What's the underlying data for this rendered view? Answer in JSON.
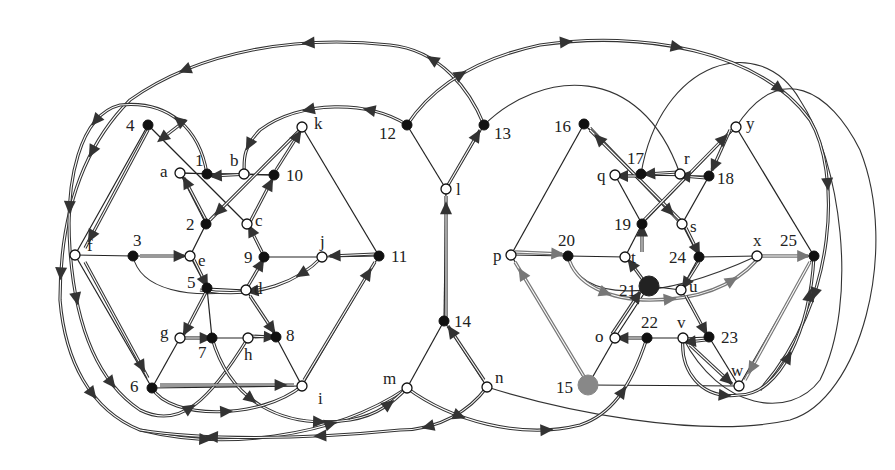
{
  "diagram": {
    "colors": {
      "edge": "#222222",
      "path_dark": "#333333",
      "path_gray": "#777777",
      "node_filled": "#111111",
      "node_open": "#ffffff",
      "node_special_gray": "#888888"
    },
    "nodes": [
      {
        "id": "4",
        "label": "4",
        "x": 148,
        "y": 125,
        "type": "filled",
        "lx": -22,
        "ly": 6
      },
      {
        "id": "k",
        "label": "k",
        "x": 302,
        "y": 127,
        "type": "open",
        "lx": 12,
        "ly": 2
      },
      {
        "id": "a",
        "label": "a",
        "x": 180,
        "y": 173,
        "type": "open",
        "lx": -20,
        "ly": 4
      },
      {
        "id": "1",
        "label": "1",
        "x": 207,
        "y": 174,
        "type": "filled",
        "lx": -12,
        "ly": -8
      },
      {
        "id": "b",
        "label": "b",
        "x": 244,
        "y": 174,
        "type": "open",
        "lx": -14,
        "ly": -8
      },
      {
        "id": "10",
        "label": "10",
        "x": 274,
        "y": 175,
        "type": "filled",
        "lx": 12,
        "ly": 6
      },
      {
        "id": "2",
        "label": "2",
        "x": 206,
        "y": 224,
        "type": "filled",
        "lx": -20,
        "ly": 6
      },
      {
        "id": "c",
        "label": "c",
        "x": 247,
        "y": 224,
        "type": "open",
        "lx": 8,
        "ly": 2
      },
      {
        "id": "f",
        "label": "f",
        "x": 75,
        "y": 255,
        "type": "open",
        "lx": 12,
        "ly": -4
      },
      {
        "id": "3",
        "label": "3",
        "x": 133,
        "y": 256,
        "type": "filled",
        "lx": 0,
        "ly": -10
      },
      {
        "id": "e",
        "label": "e",
        "x": 190,
        "y": 256,
        "type": "open",
        "lx": 8,
        "ly": 10
      },
      {
        "id": "9",
        "label": "9",
        "x": 264,
        "y": 257,
        "type": "filled",
        "lx": -20,
        "ly": 6
      },
      {
        "id": "j",
        "label": "j",
        "x": 322,
        "y": 257,
        "type": "open",
        "lx": -2,
        "ly": -10
      },
      {
        "id": "11",
        "label": "11",
        "x": 379,
        "y": 256,
        "type": "filled",
        "lx": 12,
        "ly": 6
      },
      {
        "id": "5",
        "label": "5",
        "x": 207,
        "y": 288,
        "type": "filled",
        "lx": -20,
        "ly": 0
      },
      {
        "id": "d",
        "label": "d",
        "x": 246,
        "y": 290,
        "type": "open",
        "lx": 8,
        "ly": 4
      },
      {
        "id": "g",
        "label": "g",
        "x": 180,
        "y": 338,
        "type": "open",
        "lx": -20,
        "ly": 0
      },
      {
        "id": "7",
        "label": "7",
        "x": 212,
        "y": 338,
        "type": "filled",
        "lx": -14,
        "ly": 20
      },
      {
        "id": "h",
        "label": "h",
        "x": 248,
        "y": 338,
        "type": "open",
        "lx": -4,
        "ly": 22
      },
      {
        "id": "8",
        "label": "8",
        "x": 276,
        "y": 337,
        "type": "filled",
        "lx": 10,
        "ly": 4
      },
      {
        "id": "6",
        "label": "6",
        "x": 152,
        "y": 388,
        "type": "filled",
        "lx": -22,
        "ly": 4
      },
      {
        "id": "i",
        "label": "i",
        "x": 302,
        "y": 386,
        "type": "open",
        "lx": 16,
        "ly": 18
      },
      {
        "id": "12",
        "label": "12",
        "x": 407,
        "y": 125,
        "type": "filled",
        "lx": -28,
        "ly": 14
      },
      {
        "id": "13",
        "label": "13",
        "x": 484,
        "y": 125,
        "type": "filled",
        "lx": 10,
        "ly": 14
      },
      {
        "id": "l",
        "label": "l",
        "x": 446,
        "y": 189,
        "type": "open",
        "lx": 10,
        "ly": 6
      },
      {
        "id": "14",
        "label": "14",
        "x": 444,
        "y": 321,
        "type": "filled",
        "lx": 10,
        "ly": 6
      },
      {
        "id": "m",
        "label": "m",
        "x": 407,
        "y": 388,
        "type": "open",
        "lx": -24,
        "ly": -4
      },
      {
        "id": "n",
        "label": "n",
        "x": 487,
        "y": 387,
        "type": "open",
        "lx": 8,
        "ly": -4
      },
      {
        "id": "16",
        "label": "16",
        "x": 584,
        "y": 124,
        "type": "filled",
        "lx": -30,
        "ly": 8
      },
      {
        "id": "y",
        "label": "y",
        "x": 736,
        "y": 127,
        "type": "open",
        "lx": 10,
        "ly": 2
      },
      {
        "id": "q",
        "label": "q",
        "x": 615,
        "y": 175,
        "type": "open",
        "lx": -18,
        "ly": 6
      },
      {
        "id": "17",
        "label": "17",
        "x": 641,
        "y": 174,
        "type": "filled",
        "lx": -14,
        "ly": -10
      },
      {
        "id": "r",
        "label": "r",
        "x": 680,
        "y": 174,
        "type": "open",
        "lx": 4,
        "ly": -10
      },
      {
        "id": "18",
        "label": "18",
        "x": 709,
        "y": 176,
        "type": "filled",
        "lx": 8,
        "ly": 8
      },
      {
        "id": "19",
        "label": "19",
        "x": 642,
        "y": 224,
        "type": "filled",
        "lx": -28,
        "ly": 6
      },
      {
        "id": "s",
        "label": "s",
        "x": 682,
        "y": 224,
        "type": "open",
        "lx": 8,
        "ly": 8
      },
      {
        "id": "p",
        "label": "p",
        "x": 511,
        "y": 255,
        "type": "open",
        "lx": -18,
        "ly": 6
      },
      {
        "id": "20",
        "label": "20",
        "x": 568,
        "y": 256,
        "type": "filled",
        "lx": -10,
        "ly": -10
      },
      {
        "id": "t",
        "label": "t",
        "x": 625,
        "y": 257,
        "type": "open",
        "lx": 6,
        "ly": 6
      },
      {
        "id": "24",
        "label": "24",
        "x": 699,
        "y": 257,
        "type": "filled",
        "lx": -30,
        "ly": 6
      },
      {
        "id": "x",
        "label": "x",
        "x": 757,
        "y": 256,
        "type": "open",
        "lx": -4,
        "ly": -10
      },
      {
        "id": "25",
        "label": "25",
        "x": 814,
        "y": 256,
        "type": "filled",
        "lx": -34,
        "ly": -10
      },
      {
        "id": "21",
        "label": "21",
        "x": 649,
        "y": 286,
        "type": "big",
        "lx": -30,
        "ly": 10
      },
      {
        "id": "u",
        "label": "u",
        "x": 681,
        "y": 290,
        "type": "open",
        "lx": 8,
        "ly": 2
      },
      {
        "id": "o",
        "label": "o",
        "x": 615,
        "y": 338,
        "type": "open",
        "lx": -20,
        "ly": 4
      },
      {
        "id": "22",
        "label": "22",
        "x": 647,
        "y": 338,
        "type": "filled",
        "lx": -6,
        "ly": -10
      },
      {
        "id": "v",
        "label": "v",
        "x": 683,
        "y": 338,
        "type": "open",
        "lx": -6,
        "ly": -10
      },
      {
        "id": "23",
        "label": "23",
        "x": 709,
        "y": 337,
        "type": "filled",
        "lx": 12,
        "ly": 6
      },
      {
        "id": "15",
        "label": "15",
        "x": 588,
        "y": 385,
        "type": "gray",
        "lx": -32,
        "ly": 8
      },
      {
        "id": "w",
        "label": "w",
        "x": 739,
        "y": 386,
        "type": "open",
        "lx": -8,
        "ly": -10
      }
    ],
    "edges": [
      [
        "4",
        "f"
      ],
      [
        "4",
        "c"
      ],
      [
        "k",
        "2"
      ],
      [
        "k",
        "11"
      ],
      [
        "a",
        "10"
      ],
      [
        "a",
        "1"
      ],
      [
        "1",
        "b"
      ],
      [
        "b",
        "10"
      ],
      [
        "2",
        "a"
      ],
      [
        "2",
        "e"
      ],
      [
        "c",
        "9"
      ],
      [
        "f",
        "3"
      ],
      [
        "3",
        "e"
      ],
      [
        "f",
        "6"
      ],
      [
        "9",
        "j"
      ],
      [
        "j",
        "11"
      ],
      [
        "e",
        "5"
      ],
      [
        "9",
        "d"
      ],
      [
        "5",
        "d"
      ],
      [
        "5",
        "7"
      ],
      [
        "d",
        "8"
      ],
      [
        "g",
        "7"
      ],
      [
        "7",
        "h"
      ],
      [
        "h",
        "8"
      ],
      [
        "g",
        "6"
      ],
      [
        "8",
        "i"
      ],
      [
        "6",
        "i"
      ],
      [
        "11",
        "i"
      ],
      [
        "12",
        "l"
      ],
      [
        "13",
        "l"
      ],
      [
        "l",
        "14"
      ],
      [
        "14",
        "m"
      ],
      [
        "14",
        "n"
      ],
      [
        "16",
        "p"
      ],
      [
        "16",
        "s"
      ],
      [
        "y",
        "19"
      ],
      [
        "y",
        "25"
      ],
      [
        "q",
        "18"
      ],
      [
        "19",
        "q"
      ],
      [
        "19",
        "t"
      ],
      [
        "s",
        "18"
      ],
      [
        "s",
        "24"
      ],
      [
        "p",
        "20"
      ],
      [
        "20",
        "t"
      ],
      [
        "24",
        "x"
      ],
      [
        "x",
        "25"
      ],
      [
        "t",
        "21"
      ],
      [
        "24",
        "u"
      ],
      [
        "21",
        "u"
      ],
      [
        "21",
        "o"
      ],
      [
        "u",
        "23"
      ],
      [
        "o",
        "22"
      ],
      [
        "22",
        "v"
      ],
      [
        "v",
        "23"
      ],
      [
        "o",
        "15"
      ],
      [
        "23",
        "w"
      ],
      [
        "15",
        "w"
      ],
      [
        "25",
        "w"
      ],
      [
        "p",
        "15"
      ]
    ],
    "thin_curves": [
      "M 484 125 C 540 70, 640 60, 680 174",
      "M 641 174 C 660 60, 760 30, 800 100 C 840 160, 860 300, 820 380 C 790 420, 720 410, 683 338",
      "M 487 387 C 560 410, 700 440, 790 420 C 860 400, 900 250, 860 150 C 830 90, 780 60, 736 127",
      "M 133 256 C 140 290, 190 300, 246 290",
      "M 568 256 C 580 300, 650 305, 757 256"
    ],
    "dark_paths": [
      {
        "d": "M 484 125 C 470 90, 440 50, 390 45 C 300 35, 200 50, 130 100 C 80 150, 60 220, 60 300 C 65 360, 90 410, 140 430 C 220 450, 330 440, 407 388",
        "arrows": [
          0.08,
          0.2,
          0.32,
          0.44,
          0.56,
          0.68,
          0.8,
          0.92
        ]
      },
      {
        "d": "M 407 125 C 370 100, 300 100, 260 130 C 240 150, 245 165, 244 174",
        "arrows": [
          0.2,
          0.5,
          0.85
        ]
      },
      {
        "d": "M 207 174 C 200 130, 170 100, 120 105 C 80 115, 65 180, 70 250 C 75 320, 95 380, 140 410 C 180 430, 210 400, 248 338",
        "arrows": [
          0.1,
          0.25,
          0.4,
          0.55,
          0.7,
          0.85
        ]
      },
      {
        "d": "M 407 125 C 430 90, 470 60, 540 45 C 640 30, 760 50, 810 120 C 840 170, 840 300, 760 390",
        "arrows": [
          0.1,
          0.25,
          0.4,
          0.55,
          0.7,
          0.85
        ]
      },
      {
        "d": "M 407 388 C 450 420, 520 440, 580 425 C 610 415, 630 390, 647 338",
        "arrows": [
          0.2,
          0.5,
          0.8
        ]
      },
      {
        "d": "M 212 338 C 230 400, 280 430, 350 420 C 380 415, 395 400, 407 388",
        "arrows": [
          0.3,
          0.6,
          0.9
        ]
      },
      {
        "d": "M 152 388 C 170 420, 260 420, 302 386",
        "arrows": [
          0.5
        ]
      },
      {
        "d": "M 487 387 C 470 410, 440 430, 400 430 C 300 440, 200 440, 140 430",
        "arrows": [
          0.2,
          0.5,
          0.8
        ]
      },
      {
        "d": "M 683 338 C 680 370, 700 400, 739 395 C 780 395, 810 330, 814 256",
        "arrows": [
          0.3,
          0.6,
          0.85
        ]
      },
      {
        "d": "M 322 257 C 300 280, 260 300, 200 290",
        "arrows": [
          0.2,
          0.6
        ]
      }
    ],
    "straight_arrows": [
      {
        "from": [
          148,
          130
        ],
        "to": [
          85,
          248
        ],
        "type": "dark"
      },
      {
        "from": [
          85,
          262
        ],
        "to": [
          148,
          378
        ],
        "type": "dark"
      },
      {
        "from": [
          160,
          385
        ],
        "to": [
          294,
          385
        ],
        "type": "dark"
      },
      {
        "from": [
          304,
          380
        ],
        "to": [
          375,
          262
        ],
        "type": "dark"
      },
      {
        "from": [
          375,
          254
        ],
        "to": [
          330,
          256
        ],
        "type": "dark"
      },
      {
        "from": [
          140,
          256
        ],
        "to": [
          184,
          256
        ],
        "type": "dark"
      },
      {
        "from": [
          206,
          220
        ],
        "to": [
          184,
          178
        ],
        "type": "dark"
      },
      {
        "from": [
          250,
          174
        ],
        "to": [
          212,
          176
        ],
        "type": "dark"
      },
      {
        "from": [
          250,
          222
        ],
        "to": [
          272,
          180
        ],
        "type": "dark"
      },
      {
        "from": [
          300,
          130
        ],
        "to": [
          210,
          220
        ],
        "type": "dark"
      },
      {
        "from": [
          276,
          170
        ],
        "to": [
          300,
          132
        ],
        "type": "dark"
      },
      {
        "from": [
          262,
          252
        ],
        "to": [
          250,
          228
        ],
        "type": "dark"
      },
      {
        "from": [
          194,
          260
        ],
        "to": [
          206,
          284
        ],
        "type": "dark"
      },
      {
        "from": [
          248,
          286
        ],
        "to": [
          262,
          262
        ],
        "type": "dark"
      },
      {
        "from": [
          206,
          292
        ],
        "to": [
          184,
          334
        ],
        "type": "dark"
      },
      {
        "from": [
          185,
          338
        ],
        "to": [
          208,
          338
        ],
        "type": "dark"
      },
      {
        "from": [
          250,
          336
        ],
        "to": [
          272,
          337
        ],
        "type": "dark"
      },
      {
        "from": [
          250,
          296
        ],
        "to": [
          274,
          332
        ],
        "type": "dark"
      },
      {
        "from": [
          186,
          120
        ],
        "to": [
          160,
          140
        ],
        "type": "dark"
      },
      {
        "from": [
          446,
          318
        ],
        "to": [
          446,
          196
        ],
        "type": "dark"
      },
      {
        "from": [
          448,
          185
        ],
        "to": [
          480,
          130
        ],
        "type": "dark"
      },
      {
        "from": [
          484,
          380
        ],
        "to": [
          448,
          326
        ],
        "type": "dark"
      },
      {
        "from": [
          590,
          128
        ],
        "to": [
          678,
          220
        ],
        "type": "dark"
      },
      {
        "from": [
          680,
          220
        ],
        "to": [
          590,
          130
        ],
        "type": "dark"
      },
      {
        "from": [
          644,
          220
        ],
        "to": [
          732,
          130
        ],
        "type": "dark"
      },
      {
        "from": [
          706,
          178
        ],
        "to": [
          682,
          176
        ],
        "type": "dark"
      },
      {
        "from": [
          678,
          172
        ],
        "to": [
          646,
          174
        ],
        "type": "dark"
      },
      {
        "from": [
          640,
          176
        ],
        "to": [
          620,
          176
        ],
        "type": "dark"
      },
      {
        "from": [
          730,
          130
        ],
        "to": [
          712,
          170
        ],
        "type": "dark"
      },
      {
        "from": [
          642,
          252
        ],
        "to": [
          642,
          228
        ],
        "type": "dark"
      },
      {
        "from": [
          686,
          228
        ],
        "to": [
          698,
          252
        ],
        "type": "dark"
      },
      {
        "from": [
          699,
          262
        ],
        "to": [
          684,
          286
        ],
        "type": "dark"
      },
      {
        "from": [
          646,
          284
        ],
        "to": [
          630,
          262
        ],
        "type": "dark"
      },
      {
        "from": [
          612,
          334
        ],
        "to": [
          640,
          292
        ],
        "type": "dark"
      },
      {
        "from": [
          644,
          338
        ],
        "to": [
          620,
          338
        ],
        "type": "dark"
      },
      {
        "from": [
          686,
          296
        ],
        "to": [
          706,
          333
        ],
        "type": "dark"
      },
      {
        "from": [
          706,
          340
        ],
        "to": [
          688,
          342
        ],
        "type": "dark"
      },
      {
        "from": [
          690,
          345
        ],
        "to": [
          732,
          384
        ],
        "type": "dark"
      },
      {
        "from": [
          515,
          252
        ],
        "to": [
          562,
          254
        ],
        "type": "gray"
      },
      {
        "from": [
          760,
          256
        ],
        "to": [
          808,
          256
        ],
        "type": "gray"
      },
      {
        "from": [
          810,
          262
        ],
        "to": [
          745,
          380
        ],
        "type": "gray"
      },
      {
        "from": [
          586,
          380
        ],
        "to": [
          515,
          262
        ],
        "type": "gray"
      }
    ],
    "gray_paths": [
      {
        "d": "M 568 256 C 575 285, 610 300, 650 300 C 690 300, 730 290, 757 260",
        "arrows": [
          0.25,
          0.55,
          0.85
        ]
      }
    ]
  }
}
